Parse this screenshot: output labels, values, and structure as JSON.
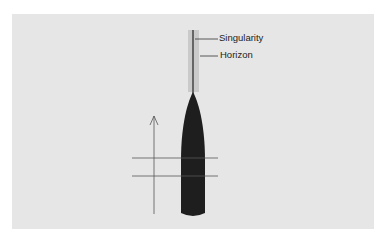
{
  "diagram": {
    "labels": {
      "singularity": "Singularity",
      "horizon": "Horizon"
    },
    "colors": {
      "background": "#e6e6e6",
      "body": "#1e1e1e",
      "horizon_band": "#c8c8c8",
      "lines": "#555555"
    }
  }
}
